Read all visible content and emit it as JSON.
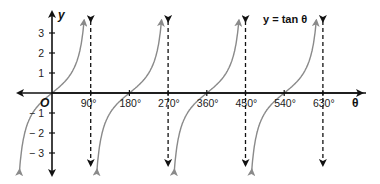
{
  "chart_data": {
    "type": "line",
    "title": "y = tan θ",
    "xlabel": "θ",
    "ylabel": "y",
    "origin_label": "O",
    "function": "tan",
    "xlim": [
      -45,
      665
    ],
    "ylim": [
      -4,
      4
    ],
    "x_ticks": [
      90,
      180,
      270,
      360,
      450,
      540,
      630
    ],
    "x_tick_labels": [
      "90°",
      "180°",
      "270°",
      "360°",
      "450°",
      "540°",
      "630°"
    ],
    "y_ticks": [
      3,
      2,
      1,
      -1,
      -2,
      -3
    ],
    "y_tick_labels": [
      "3",
      "2",
      "1",
      "− 1",
      "− 2",
      "− 3"
    ],
    "asymptotes": [
      90,
      270,
      450,
      630
    ],
    "branches": [
      {
        "from": -45,
        "to": 90
      },
      {
        "from": 90,
        "to": 270
      },
      {
        "from": 270,
        "to": 450
      },
      {
        "from": 450,
        "to": 630
      }
    ],
    "colors": {
      "curve": "#8a8a8a",
      "axis": "#111111",
      "asymptote": "#111111"
    }
  }
}
